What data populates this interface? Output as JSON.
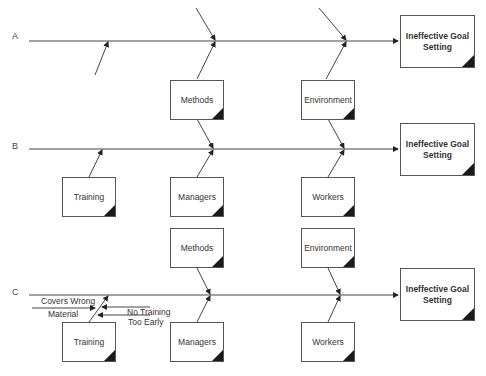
{
  "diagram": {
    "type": "fishbone / cause-and-effect",
    "rows": [
      {
        "label": "A",
        "effect": "Ineffective Goal Setting",
        "causes_above": [],
        "causes_below": [
          "Methods",
          "Environment"
        ],
        "sub_causes": []
      },
      {
        "label": "B",
        "effect": "Ineffective Goal Setting",
        "causes_above": [
          "Methods",
          "Environment"
        ],
        "causes_below": [
          "Training",
          "Managers",
          "Workers"
        ],
        "sub_causes": []
      },
      {
        "label": "C",
        "effect": "Ineffective Goal Setting",
        "causes_above": [
          "Methods",
          "Environment"
        ],
        "causes_below": [
          "Training",
          "Managers",
          "Workers"
        ],
        "sub_causes": [
          {
            "parent": "Training",
            "text_line1": "Covers Wrong",
            "text_line2": "Material"
          },
          {
            "parent": "Training",
            "text_line1": "No Training",
            "text_line2": "Too Early"
          }
        ]
      }
    ]
  },
  "colors": {
    "line": "#444444",
    "box_border": "#555555",
    "corner": "#1a1a1a"
  }
}
